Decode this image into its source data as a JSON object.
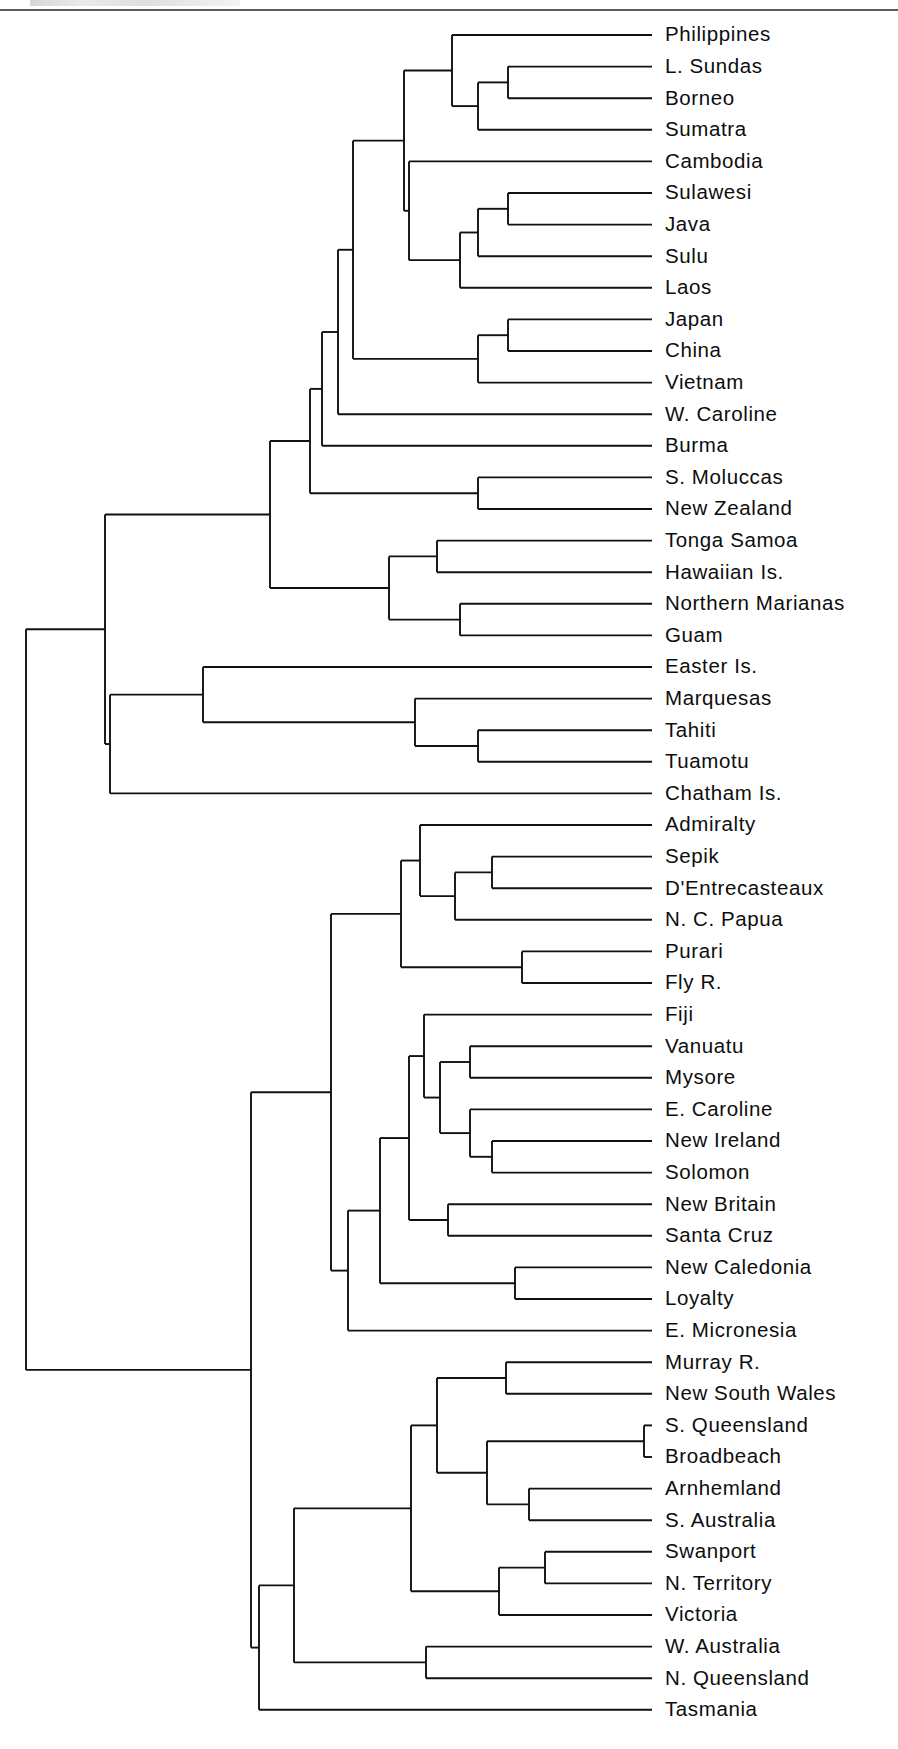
{
  "figure": {
    "type": "dendrogram",
    "orientation": "horizontal-right",
    "title": "",
    "leaf_count": 58,
    "colors": {
      "branch": "#111111",
      "label": "#0d0d0d",
      "background": "#ffffff",
      "rule": "#5a5a5a"
    },
    "geometry": {
      "leaf_tip_x": 652,
      "label_x": 665,
      "first_leaf_y": 35,
      "leaf_spacing": 31.6,
      "root_x": 26
    }
  },
  "chart_data": {
    "type": "tree",
    "title": "",
    "xlabel": "",
    "ylabel": "",
    "leaves": [
      "Philippines",
      "L. Sundas",
      "Borneo",
      "Sumatra",
      "Cambodia",
      "Sulawesi",
      "Java",
      "Sulu",
      "Laos",
      "Japan",
      "China",
      "Vietnam",
      "W. Caroline",
      "Burma",
      "S. Moluccas",
      "New Zealand",
      "Tonga Samoa",
      "Hawaiian Is.",
      "Northern Marianas",
      "Guam",
      "Easter Is.",
      "Marquesas",
      "Tahiti",
      "Tuamotu",
      "Chatham Is.",
      "Admiralty",
      "Sepik",
      "D'Entrecasteaux",
      "N. C. Papua",
      "Purari",
      "Fly R.",
      "Fiji",
      "Vanuatu",
      "Mysore",
      "E. Caroline",
      "New Ireland",
      "Solomon",
      "New Britain",
      "Santa Cruz",
      "New Caledonia",
      "Loyalty",
      "E. Micronesia",
      "Murray R.",
      "New South Wales",
      "S. Queensland",
      "Broadbeach",
      "Arnhemland",
      "S. Australia",
      "Swanport",
      "N. Territory",
      "Victoria",
      "W. Australia",
      "N. Queensland",
      "Tasmania"
    ],
    "nodes": [
      {
        "id": "n_lsundas_borneo",
        "x": 508,
        "children": [
          "L. Sundas",
          "Borneo"
        ]
      },
      {
        "id": "n_lb_sumatra",
        "x": 478,
        "children": [
          "n_lsundas_borneo",
          "Sumatra"
        ]
      },
      {
        "id": "n_phil_sunda",
        "x": 452,
        "children": [
          "Philippines",
          "n_lb_sumatra"
        ]
      },
      {
        "id": "n_sulawesi_java",
        "x": 508,
        "children": [
          "Sulawesi",
          "Java"
        ]
      },
      {
        "id": "n_sj_sulu",
        "x": 478,
        "children": [
          "n_sulawesi_java",
          "Sulu"
        ]
      },
      {
        "id": "n_sjs_laos",
        "x": 460,
        "children": [
          "n_sj_sulu",
          "Laos"
        ]
      },
      {
        "id": "n_camb_grp",
        "x": 409,
        "children": [
          "Cambodia",
          "n_sjs_laos"
        ]
      },
      {
        "id": "n_wmp",
        "x": 404,
        "children": [
          "n_phil_sunda",
          "n_camb_grp"
        ]
      },
      {
        "id": "n_japan_china",
        "x": 508,
        "children": [
          "Japan",
          "China"
        ]
      },
      {
        "id": "n_jc_vietnam",
        "x": 478,
        "children": [
          "n_japan_china",
          "Vietnam"
        ]
      },
      {
        "id": "n_wmp_ea",
        "x": 353,
        "children": [
          "n_wmp",
          "n_jc_vietnam"
        ]
      },
      {
        "id": "n_plus_wcaroline",
        "x": 338,
        "children": [
          "n_wmp_ea",
          "W. Caroline"
        ]
      },
      {
        "id": "n_plus_burma",
        "x": 322,
        "children": [
          "n_plus_wcaroline",
          "Burma"
        ]
      },
      {
        "id": "n_smol_nz",
        "x": 478,
        "children": [
          "S. Moluccas",
          "New Zealand"
        ]
      },
      {
        "id": "n_asia_clade",
        "x": 310,
        "children": [
          "n_plus_burma",
          "n_smol_nz"
        ]
      },
      {
        "id": "n_tonga_hawaii",
        "x": 437,
        "children": [
          "Tonga Samoa",
          "Hawaiian Is."
        ]
      },
      {
        "id": "n_marianas_guam",
        "x": 460,
        "children": [
          "Northern Marianas",
          "Guam"
        ]
      },
      {
        "id": "n_micro_poly",
        "x": 389,
        "children": [
          "n_tonga_hawaii",
          "n_marianas_guam"
        ]
      },
      {
        "id": "n_asia_oceania",
        "x": 270,
        "children": [
          "n_asia_clade",
          "n_micro_poly"
        ]
      },
      {
        "id": "n_tahiti_tuamotu",
        "x": 478,
        "children": [
          "Tahiti",
          "Tuamotu"
        ]
      },
      {
        "id": "n_marq_tt",
        "x": 415,
        "children": [
          "Marquesas",
          "n_tahiti_tuamotu"
        ]
      },
      {
        "id": "n_easter_epoly",
        "x": 203,
        "children": [
          "Easter Is.",
          "n_marq_tt"
        ]
      },
      {
        "id": "n_epoly_chatham",
        "x": 110,
        "children": [
          "n_easter_epoly",
          "Chatham Is."
        ]
      },
      {
        "id": "n_northwest",
        "x": 105,
        "children": [
          "n_asia_oceania",
          "n_epoly_chatham"
        ]
      },
      {
        "id": "n_sepik_dentre",
        "x": 492,
        "children": [
          "Sepik",
          "D'Entrecasteaux"
        ]
      },
      {
        "id": "n_sd_ncpapua",
        "x": 455,
        "children": [
          "n_sepik_dentre",
          "N. C. Papua"
        ]
      },
      {
        "id": "n_admiralty_grp",
        "x": 420,
        "children": [
          "Admiralty",
          "n_sd_ncpapua"
        ]
      },
      {
        "id": "n_purari_fly",
        "x": 522,
        "children": [
          "Purari",
          "Fly R."
        ]
      },
      {
        "id": "n_papua",
        "x": 401,
        "children": [
          "n_admiralty_grp",
          "n_purari_fly"
        ]
      },
      {
        "id": "n_vanuatu_mysore",
        "x": 470,
        "children": [
          "Vanuatu",
          "Mysore"
        ]
      },
      {
        "id": "n_nireland_solomon",
        "x": 492,
        "children": [
          "New Ireland",
          "Solomon"
        ]
      },
      {
        "id": "n_ecar_nis",
        "x": 470,
        "children": [
          "E. Caroline",
          "n_nireland_solomon"
        ]
      },
      {
        "id": "n_vm_ecar",
        "x": 440,
        "children": [
          "n_vanuatu_mysore",
          "n_ecar_nis"
        ]
      },
      {
        "id": "n_fiji_grp",
        "x": 424,
        "children": [
          "Fiji",
          "n_vm_ecar"
        ]
      },
      {
        "id": "n_nbritain_santa",
        "x": 448,
        "children": [
          "New Britain",
          "Santa Cruz"
        ]
      },
      {
        "id": "n_fiji_nbritain",
        "x": 409,
        "children": [
          "n_fiji_grp",
          "n_nbritain_santa"
        ]
      },
      {
        "id": "n_ncal_loyalty",
        "x": 515,
        "children": [
          "New Caledonia",
          "Loyalty"
        ]
      },
      {
        "id": "n_oceanic_core",
        "x": 380,
        "children": [
          "n_fiji_nbritain",
          "n_ncal_loyalty"
        ]
      },
      {
        "id": "n_oceanic_emicro",
        "x": 348,
        "children": [
          "n_oceanic_core",
          "E. Micronesia"
        ]
      },
      {
        "id": "n_melanesia",
        "x": 331,
        "children": [
          "n_papua",
          "n_oceanic_emicro"
        ]
      },
      {
        "id": "n_murray_nsw",
        "x": 506,
        "children": [
          "Murray R.",
          "New South Wales"
        ]
      },
      {
        "id": "n_squeens_broad",
        "x": 644,
        "children": [
          "S. Queensland",
          "Broadbeach"
        ]
      },
      {
        "id": "n_arnhem_saus",
        "x": 529,
        "children": [
          "Arnhemland",
          "S. Australia"
        ]
      },
      {
        "id": "n_sqb_arnhem",
        "x": 487,
        "children": [
          "n_squeens_broad",
          "n_arnhem_saus"
        ]
      },
      {
        "id": "n_se_aus",
        "x": 437,
        "children": [
          "n_murray_nsw",
          "n_sqb_arnhem"
        ]
      },
      {
        "id": "n_swan_nterr",
        "x": 545,
        "children": [
          "Swanport",
          "N. Territory"
        ]
      },
      {
        "id": "n_swan_victoria",
        "x": 499,
        "children": [
          "n_swan_nterr",
          "Victoria"
        ]
      },
      {
        "id": "n_aus_east",
        "x": 411,
        "children": [
          "n_se_aus",
          "n_swan_victoria"
        ]
      },
      {
        "id": "n_waus_nqueens",
        "x": 426,
        "children": [
          "W. Australia",
          "N. Queensland"
        ]
      },
      {
        "id": "n_aus_main",
        "x": 294,
        "children": [
          "n_aus_east",
          "n_waus_nqueens"
        ]
      },
      {
        "id": "n_australia",
        "x": 259,
        "children": [
          "n_aus_main",
          "Tasmania"
        ]
      },
      {
        "id": "n_southeast",
        "x": 251,
        "children": [
          "n_melanesia",
          "n_australia"
        ]
      },
      {
        "id": "n_root",
        "x": 26,
        "children": [
          "n_northwest",
          "n_southeast"
        ]
      }
    ],
    "root": "n_root"
  }
}
